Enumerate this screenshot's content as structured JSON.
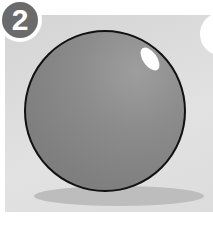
{
  "illustration": {
    "step_number": "2",
    "subject": "shaded sphere",
    "colors": {
      "background": "#dcdcdc",
      "sphere": "#868686",
      "outline": "#111111",
      "shadow": "#bdbdbd",
      "badge": "#6b6b6b",
      "highlight": "#ffffff"
    }
  }
}
